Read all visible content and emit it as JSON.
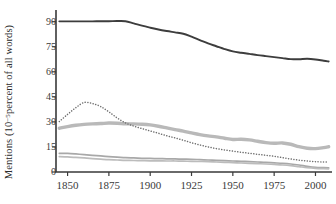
{
  "chart_data": {
    "type": "line",
    "title": "",
    "xlabel": "",
    "ylabel_text_before": "Mentions (10",
    "ylabel_exponent": "−5",
    "ylabel_text_after": " percent of all words)",
    "ylabel": "Mentions (10−5 percent of all words)",
    "grid": false,
    "legend": "none",
    "xlim": [
      1843,
      2010
    ],
    "ylim": [
      0,
      97
    ],
    "xticks": [
      1850,
      1875,
      1900,
      1925,
      1950,
      1975,
      2000
    ],
    "yticks": [
      0,
      15,
      30,
      45,
      60,
      75,
      90
    ],
    "xtick_labels": [
      "1850",
      "1875",
      "1900",
      "1925",
      "1950",
      "1975",
      "2000"
    ],
    "ytick_labels": [
      "0",
      "15",
      "30",
      "45",
      "60",
      "75",
      "90"
    ],
    "x": [
      1845,
      1850,
      1855,
      1860,
      1865,
      1870,
      1875,
      1880,
      1885,
      1890,
      1895,
      1900,
      1905,
      1910,
      1915,
      1920,
      1925,
      1930,
      1935,
      1940,
      1945,
      1950,
      1955,
      1960,
      1965,
      1970,
      1975,
      1980,
      1985,
      1990,
      1995,
      2000,
      2005,
      2008
    ],
    "series": [
      {
        "name": "series-1-top-dark",
        "style": "solid",
        "color": "#3d3d3d",
        "width": 1.9,
        "values": [
          90.2,
          90.2,
          90.2,
          90.2,
          90.2,
          90.3,
          90.3,
          90.4,
          90.3,
          89.0,
          87.6,
          86.4,
          85.3,
          84.4,
          83.6,
          82.8,
          81.0,
          79.0,
          77.0,
          75.3,
          73.6,
          72.2,
          71.4,
          70.7,
          70.0,
          69.4,
          68.8,
          68.2,
          67.6,
          67.5,
          67.8,
          67.4,
          66.6,
          66.2
        ]
      },
      {
        "name": "series-2-dotted",
        "style": "dotted",
        "color": "#6f6f6f",
        "width": 1.5,
        "values": [
          30.2,
          34.5,
          38.5,
          41.6,
          41.0,
          39.2,
          36.0,
          32.4,
          29.4,
          27.5,
          26.0,
          24.6,
          23.2,
          21.7,
          20.4,
          19.0,
          17.5,
          16.2,
          15.0,
          14.0,
          13.2,
          12.5,
          11.8,
          11.2,
          10.6,
          10.0,
          9.4,
          8.6,
          7.8,
          7.1,
          6.6,
          6.2,
          6.0,
          5.9
        ]
      },
      {
        "name": "series-3-thick-gray",
        "style": "solid",
        "color": "#b9b9b9",
        "width": 3.4,
        "values": [
          26.2,
          27.2,
          28.0,
          28.5,
          28.8,
          29.0,
          29.3,
          29.2,
          28.9,
          28.8,
          28.6,
          28.2,
          27.4,
          26.4,
          25.4,
          24.5,
          23.4,
          22.4,
          21.6,
          21.0,
          20.2,
          19.5,
          19.6,
          19.2,
          18.4,
          17.6,
          17.2,
          17.4,
          16.6,
          15.2,
          14.2,
          14.0,
          14.6,
          15.1
        ]
      },
      {
        "name": "series-4-thin-upper",
        "style": "solid",
        "color": "#a8a8a8",
        "width": 1.7,
        "values": [
          11.2,
          11.1,
          10.8,
          10.4,
          10.0,
          9.6,
          9.2,
          8.9,
          8.6,
          8.4,
          8.2,
          8.1,
          8.0,
          7.9,
          7.8,
          7.7,
          7.6,
          7.4,
          7.2,
          7.0,
          6.8,
          6.6,
          6.4,
          6.2,
          6.0,
          5.8,
          5.5,
          5.2,
          4.8,
          4.2,
          3.4,
          2.8,
          2.6,
          2.5
        ]
      },
      {
        "name": "series-5-thin-lower",
        "style": "solid",
        "color": "#bcbcbc",
        "width": 1.7,
        "values": [
          9.2,
          9.0,
          8.7,
          8.4,
          8.0,
          7.7,
          7.4,
          7.2,
          7.0,
          6.9,
          6.8,
          6.7,
          6.7,
          6.6,
          6.6,
          6.5,
          6.4,
          6.3,
          6.2,
          6.0,
          5.8,
          5.6,
          5.4,
          5.2,
          5.0,
          4.8,
          4.5,
          4.2,
          3.8,
          3.2,
          2.6,
          2.2,
          2.0,
          1.9
        ]
      }
    ],
    "axis_color": "#3a3a3a"
  }
}
